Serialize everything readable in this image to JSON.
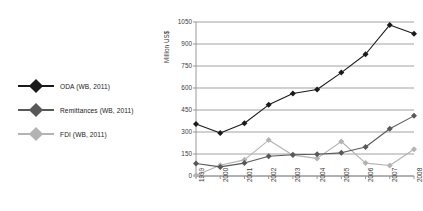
{
  "chart_data": {
    "type": "line",
    "title": "",
    "xlabel": "",
    "ylabel": "Million US$",
    "categories": [
      "1999",
      "2000",
      "2001",
      "2002",
      "2003",
      "2004",
      "2005",
      "2006",
      "2007",
      "2008"
    ],
    "x": [
      1999,
      2000,
      2001,
      2002,
      2003,
      2004,
      2005,
      2006,
      2007,
      2008
    ],
    "ylim": [
      0,
      1050
    ],
    "xlim": [
      1999,
      2008
    ],
    "yticks": [
      0,
      150,
      300,
      450,
      600,
      750,
      900,
      1050
    ],
    "grid": "horizontal",
    "legend_position": "left-outside",
    "series": [
      {
        "name": "ODA (WB, 2011)",
        "color": "#1a1a1a",
        "marker": "diamond",
        "values": [
          355,
          293,
          360,
          485,
          562,
          590,
          705,
          830,
          1030,
          970
        ]
      },
      {
        "name": "Remittances (WB, 2011)",
        "color": "#595959",
        "marker": "diamond",
        "values": [
          85,
          62,
          88,
          135,
          145,
          148,
          158,
          198,
          322,
          410
        ]
      },
      {
        "name": "FDI (WB, 2011)",
        "color": "#b3b3b3",
        "marker": "diamond",
        "values": [
          5,
          73,
          110,
          245,
          142,
          120,
          235,
          88,
          72,
          182
        ]
      }
    ]
  },
  "axis": {
    "y_title": "Million US$",
    "y_tick_labels": [
      "0",
      "150",
      "300",
      "450",
      "600",
      "750",
      "900",
      "1050"
    ],
    "x_tick_labels": [
      "1999",
      "2000",
      "2001",
      "2002",
      "2003",
      "2004",
      "2005",
      "2006",
      "2007",
      "2008"
    ]
  },
  "legend": {
    "items": [
      {
        "label": "ODA (WB, 2011)",
        "color": "#1a1a1a"
      },
      {
        "label": "Remittances (WB, 2011)",
        "color": "#595959"
      },
      {
        "label": "FDI (WB, 2011)",
        "color": "#b3b3b3"
      }
    ]
  },
  "style": {
    "background": "#ffffff",
    "gridline_color": "#8c8c8c",
    "axis_color": "#8c8c8c",
    "tick_text_color": "#3a3a3a"
  }
}
